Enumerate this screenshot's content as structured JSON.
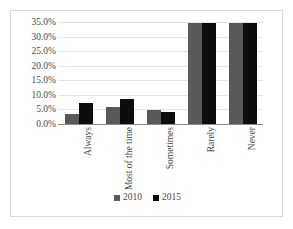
{
  "chart_data": {
    "type": "bar",
    "title": "",
    "subtitle": "",
    "xlabel": "",
    "ylabel": "",
    "categories": [
      "Always",
      "Most of the time",
      "Sometimes",
      "Rarely",
      "Never"
    ],
    "series": [
      {
        "name": "2010",
        "color": "#595959",
        "values": [
          3.8,
          6.2,
          5.0,
          35.0,
          35.0
        ]
      },
      {
        "name": "2015",
        "color": "#0d0d0d",
        "values": [
          7.7,
          9.0,
          4.3,
          35.0,
          35.0
        ]
      }
    ],
    "ylim": [
      0,
      35
    ],
    "ytick_step": 5,
    "ytick_labels": [
      "0.0%",
      "5.0%",
      "10.0%",
      "15.0%",
      "20.0%",
      "25.0%",
      "30.0%",
      "35.0%"
    ],
    "ytick_values": [
      0,
      5,
      10,
      15,
      20,
      25,
      30,
      35
    ],
    "grid": true,
    "grid_axis": "y",
    "legend": true,
    "legend_position": "bottom"
  },
  "style": {
    "gridline_color": "#e4e4e4",
    "axis_color": "#8c8c8c",
    "border_color": "#d9d9d9",
    "text_color": "#4a4a4a",
    "background": "#ffffff"
  }
}
